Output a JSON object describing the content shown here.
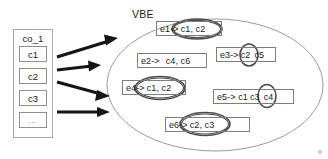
{
  "diagram": {
    "title_label": "VBE",
    "left_group": {
      "header": "co_1",
      "items": [
        {
          "label": "c1"
        },
        {
          "label": "c2"
        },
        {
          "label": "c3"
        },
        {
          "label": "..."
        }
      ]
    },
    "arrows": [
      {
        "name": "arrow-c1-to-vbe"
      },
      {
        "name": "arrow-c2-to-vbe"
      },
      {
        "name": "arrow-c3-to-vbe"
      },
      {
        "name": "arrow-more-to-vbe"
      }
    ],
    "rules": [
      {
        "id": "e1",
        "head": "e1->",
        "highlighted": "c1, c2",
        "tail": "",
        "circled": true
      },
      {
        "id": "e2",
        "head": "e2->",
        "highlighted": "",
        "tail": "c4, c6",
        "circled": false
      },
      {
        "id": "e3",
        "head": "e3->",
        "highlighted": "c2",
        "tail": "c5",
        "circled": true
      },
      {
        "id": "e4",
        "head": "e4->",
        "highlighted": "c1, c2",
        "tail": "",
        "circled": true
      },
      {
        "id": "e5",
        "head": "e5-> c1",
        "highlighted": "c3",
        "tail": "c4",
        "circled": true
      },
      {
        "id": "e6",
        "head": "e6->",
        "highlighted": "c2, c3",
        "tail": "",
        "circled": true
      }
    ],
    "colors": {
      "ink": "#1a1a1a",
      "box_border": "#7d7d7d",
      "ellipse_border": "#9a9a9a",
      "highlight_ring": "#4a4a4a",
      "arrow": "#1a1a1a",
      "background": "#ffffff"
    }
  }
}
